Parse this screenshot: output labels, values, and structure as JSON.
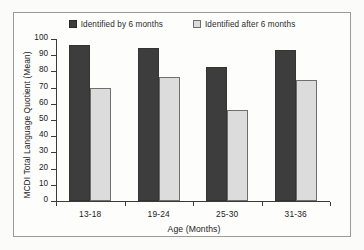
{
  "chart_data": {
    "type": "bar",
    "title": "",
    "xlabel": "Age (Months)",
    "ylabel": "MCDI Total Language Quotient (Mean)",
    "categories": [
      "13-18",
      "19-24",
      "25-30",
      "31-36"
    ],
    "series": [
      {
        "name": "Identified by 6 months",
        "values": [
          96.5,
          94.5,
          83.0,
          93.0
        ],
        "color": "#3d3d3d"
      },
      {
        "name": "Identified after 6 months",
        "values": [
          69.5,
          76.5,
          56.0,
          75.0
        ],
        "color": "#dcdcdc"
      }
    ],
    "ylim": [
      0,
      100
    ],
    "yticks": [
      0,
      10,
      20,
      30,
      40,
      50,
      60,
      70,
      80,
      90,
      100
    ],
    "ytick_labels": [
      "0",
      "10",
      "20",
      "30",
      "40",
      "50",
      "60",
      "70",
      "80",
      "90",
      "100"
    ],
    "grid": false,
    "legend_position": "top-center"
  }
}
